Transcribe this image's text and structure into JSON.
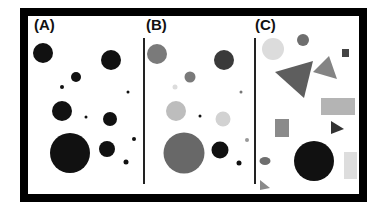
{
  "panels": [
    {
      "id": "A",
      "label": "(A)"
    },
    {
      "id": "B",
      "label": "(B)"
    },
    {
      "id": "C",
      "label": "(C)"
    }
  ],
  "colors": {
    "frame": "#000000",
    "black": "#111111",
    "dark_gray": "#444444",
    "mid_gray": "#6e6e6e",
    "gray": "#8a8a8a",
    "light_gray": "#bdbdbd",
    "pale_gray": "#dcdcdc"
  },
  "panel_a_circles": [
    {
      "cx": 43,
      "cy": 53,
      "r": 10
    },
    {
      "cx": 111,
      "cy": 60,
      "r": 10
    },
    {
      "cx": 76,
      "cy": 77,
      "r": 5
    },
    {
      "cx": 62,
      "cy": 87,
      "r": 2
    },
    {
      "cx": 128,
      "cy": 92,
      "r": 1.5
    },
    {
      "cx": 62,
      "cy": 111,
      "r": 10
    },
    {
      "cx": 86,
      "cy": 117,
      "r": 1.5
    },
    {
      "cx": 110,
      "cy": 119,
      "r": 7
    },
    {
      "cx": 134,
      "cy": 139,
      "r": 2
    },
    {
      "cx": 70,
      "cy": 153,
      "r": 20
    },
    {
      "cx": 107,
      "cy": 149,
      "r": 8
    },
    {
      "cx": 126,
      "cy": 162,
      "r": 2.5
    }
  ],
  "panel_b_circles": [
    {
      "cx": 157,
      "cy": 54,
      "r": 10,
      "fill": "#7a7a7a"
    },
    {
      "cx": 224,
      "cy": 60,
      "r": 10,
      "fill": "#3a3a3a"
    },
    {
      "cx": 190,
      "cy": 77,
      "r": 5.5,
      "fill": "#7a7a7a"
    },
    {
      "cx": 175,
      "cy": 87,
      "r": 2.5,
      "fill": "#dcdcdc"
    },
    {
      "cx": 241,
      "cy": 92,
      "r": 1.5,
      "fill": "#777777"
    },
    {
      "cx": 176,
      "cy": 111,
      "r": 10,
      "fill": "#bdbdbd"
    },
    {
      "cx": 200,
      "cy": 116,
      "r": 1.5,
      "fill": "#111111"
    },
    {
      "cx": 223,
      "cy": 119,
      "r": 7.5,
      "fill": "#d2d2d2"
    },
    {
      "cx": 247,
      "cy": 140,
      "r": 2,
      "fill": "#999999"
    },
    {
      "cx": 184,
      "cy": 153,
      "r": 20.5,
      "fill": "#686868"
    },
    {
      "cx": 220,
      "cy": 150,
      "r": 8.5,
      "fill": "#111111"
    },
    {
      "cx": 239,
      "cy": 163,
      "r": 2.5,
      "fill": "#111111"
    }
  ],
  "panel_c_shapes": [
    {
      "type": "circle",
      "cx": 273,
      "cy": 49,
      "r": 11,
      "fill": "#dcdcdc"
    },
    {
      "type": "circle",
      "cx": 303,
      "cy": 40,
      "r": 6,
      "fill": "#6e6e6e"
    },
    {
      "type": "rect",
      "x": 342,
      "y": 49,
      "w": 7,
      "h": 8,
      "fill": "#444444"
    },
    {
      "type": "polygon",
      "points": "275,72 313,61 304,98",
      "fill": "#5e5e5e"
    },
    {
      "type": "polygon",
      "points": "313,72 329,56 337,79",
      "fill": "#848484"
    },
    {
      "type": "rect",
      "x": 321,
      "y": 98,
      "w": 34,
      "h": 17,
      "fill": "#b4b4b4"
    },
    {
      "type": "rect",
      "x": 275,
      "y": 119,
      "w": 14,
      "h": 18,
      "fill": "#8a8a8a"
    },
    {
      "type": "polygon",
      "points": "331,121 344,129 331,134",
      "fill": "#333333"
    },
    {
      "type": "circle",
      "cx": 314,
      "cy": 161,
      "r": 20,
      "fill": "#111111"
    },
    {
      "type": "rect",
      "x": 344,
      "y": 152,
      "w": 13,
      "h": 27,
      "fill": "#dddddd"
    },
    {
      "type": "ellipse",
      "cx": 265,
      "cy": 161,
      "rx": 5.5,
      "ry": 4,
      "fill": "#6e6e6e"
    },
    {
      "type": "polygon",
      "points": "260,180 270,188 260,190",
      "fill": "#8a8a8a"
    }
  ]
}
